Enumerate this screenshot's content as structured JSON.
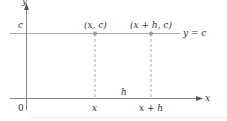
{
  "diagram": {
    "axes": {
      "x_label": "x",
      "y_label": "y",
      "origin_label": "0"
    },
    "line": {
      "equation_label": "y = c",
      "y_intercept_label": "c",
      "color": "#a8a8a8"
    },
    "points": [
      {
        "label": "(x, c)",
        "x_tick_label": "x"
      },
      {
        "label": "(x + h, c)",
        "x_tick_label": "x + h"
      }
    ],
    "interval_label": "h",
    "colors": {
      "axis": "#555555",
      "line": "#a8a8a8",
      "dashed": "#b0b0b0",
      "point": "#9a9a9a",
      "text": "#333333"
    }
  }
}
